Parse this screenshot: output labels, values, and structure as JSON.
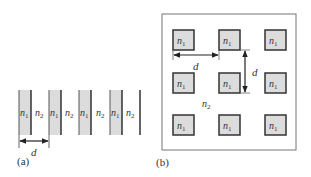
{
  "figure": {
    "panel_a": {
      "caption": "(a)",
      "layers": [
        {
          "label": "n",
          "sub": "1",
          "type": "high"
        },
        {
          "label": "n",
          "sub": "2",
          "type": "low"
        },
        {
          "label": "n",
          "sub": "1",
          "type": "high"
        },
        {
          "label": "n",
          "sub": "2",
          "type": "low"
        },
        {
          "label": "n",
          "sub": "1",
          "type": "high"
        },
        {
          "label": "n",
          "sub": "2",
          "type": "low"
        },
        {
          "label": "n",
          "sub": "1",
          "type": "high"
        },
        {
          "label": "n",
          "sub": "2",
          "type": "low"
        }
      ],
      "period_label": "d"
    },
    "panel_b": {
      "caption": "(b)",
      "cell_label": "n",
      "cell_sub": "1",
      "background_label": "n",
      "background_sub": "2",
      "grid": {
        "rows": 3,
        "cols": 3
      },
      "horizontal_period_label": "d",
      "vertical_period_label": "d"
    },
    "colors": {
      "fill_high": "#dcdcdc",
      "stroke": "#333333",
      "frame": "#777777"
    }
  }
}
